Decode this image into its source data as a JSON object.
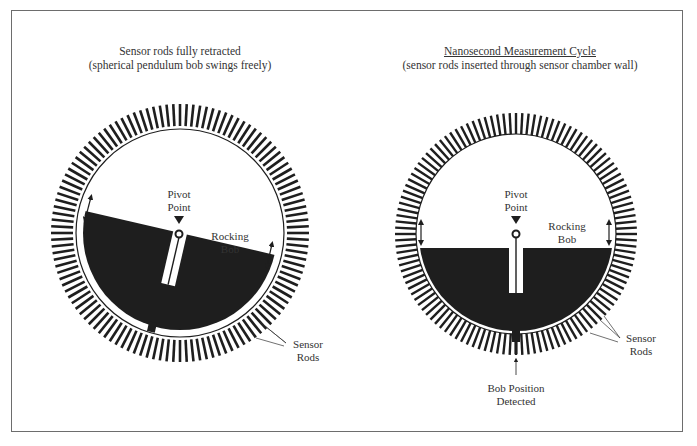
{
  "left_panel": {
    "title_line1": "Sensor rods fully retracted",
    "title_line2": "(spherical pendulum bob swings freely)",
    "pivot_label_line1": "Pivot",
    "pivot_label_line2": "Point",
    "bob_label_line1": "Rocking",
    "bob_label_line2": "Bob",
    "sensor_label_line1": "Sensor",
    "sensor_label_line2": "Rods",
    "bob_tilt_deg": -13
  },
  "right_panel": {
    "title_line1": "Nanosecond Measurement Cycle",
    "title_line2": "(sensor rods inserted through sensor chamber wall)",
    "pivot_label_line1": "Pivot",
    "pivot_label_line2": "Point",
    "bob_label_line1": "Rocking",
    "bob_label_line2": "Bob",
    "sensor_label_line1": "Sensor",
    "sensor_label_line2": "Rods",
    "detected_label_line1": "Bob Position",
    "detected_label_line2": "Detected",
    "bob_tilt_deg": 0
  },
  "colors": {
    "ink": "#1e1e1e",
    "frame": "#6d6d6d",
    "background": "#ffffff"
  }
}
